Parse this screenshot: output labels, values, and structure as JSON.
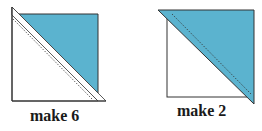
{
  "colors": {
    "fabric": "#5bb3cf",
    "outline": "#333333",
    "background": "#ffffff"
  },
  "units": [
    {
      "id": "unit-left",
      "label": "make 6",
      "description": "square with narrow white triangle strip along diagonal and blue triangle, stitching line dashed"
    },
    {
      "id": "unit-right",
      "label": "make 2",
      "description": "white square with large blue triangle overlapping diagonally, stitching line dashed"
    }
  ]
}
